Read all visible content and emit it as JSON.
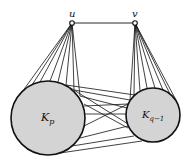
{
  "diagram": {
    "vertices": [
      {
        "id": "u",
        "label": "u",
        "x": 72,
        "y": 23
      },
      {
        "id": "v",
        "label": "v",
        "x": 135,
        "y": 23
      }
    ],
    "cliques": [
      {
        "id": "Kp",
        "label_main": "K",
        "label_sub": "p",
        "cx": 48,
        "cy": 118,
        "r": 37
      },
      {
        "id": "Kq1",
        "label_main": "K",
        "label_sub": "q−1",
        "cx": 153,
        "cy": 115,
        "r": 27
      }
    ],
    "edges": [
      {
        "from": "u",
        "to": "v"
      }
    ],
    "colors": {
      "circle_fill": "#d4d4d4",
      "stroke": "#111111",
      "background": "#ffffff"
    }
  }
}
